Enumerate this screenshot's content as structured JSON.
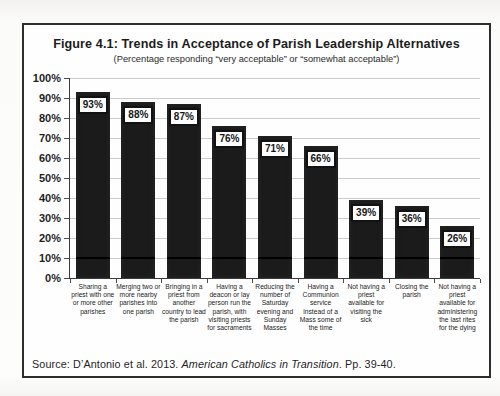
{
  "figure": {
    "title": "Figure 4.1: Trends in Acceptance of Parish Leadership Alternatives",
    "subtitle": "(Percentage responding “very acceptable” or “somewhat acceptable”)",
    "source": {
      "prefix": "Source: D’Antonio et al. 2013. ",
      "italic": "American Catholics in Transition",
      "suffix": ". Pp. 39-40."
    }
  },
  "colors": {
    "bar": "#1b1b1b",
    "gridline": "#cbcbc9",
    "frame_border": "#2d2d2d",
    "value_box_bg": "#fdfdfd",
    "value_box_border": "#121212"
  },
  "chart_data": {
    "type": "bar",
    "title": "Figure 4.1: Trends in Acceptance of Parish Leadership Alternatives",
    "subtitle": "(Percentage responding “very acceptable” or “somewhat acceptable”)",
    "categories": [
      "Sharing a priest with one or more other parishes",
      "Merging two or more nearby parishes into one parish",
      "Bringing in a priest from another country to lead the parish",
      "Having a deacon or lay person run the parish, with visiting priests for sacraments",
      "Reducing the number of Saturday evening and Sunday Masses",
      "Having a Communion service instead of a Mass some of the time",
      "Not having a priest available for visiting the sick",
      "Closing the parish",
      "Not having a priest available for administering the last rites for the dying"
    ],
    "values": [
      93,
      88,
      87,
      76,
      71,
      66,
      39,
      36,
      26
    ],
    "value_labels": [
      "93%",
      "88%",
      "87%",
      "76%",
      "71%",
      "66%",
      "39%",
      "36%",
      "26%"
    ],
    "xlabel": "",
    "ylabel": "",
    "ylim": [
      0,
      100
    ],
    "ytick_step": 10,
    "ytick_labels": [
      "0%",
      "10%",
      "20%",
      "30%",
      "40%",
      "50%",
      "60%",
      "70%",
      "80%",
      "90%",
      "100%"
    ],
    "grid": true,
    "legend_position": "none"
  }
}
